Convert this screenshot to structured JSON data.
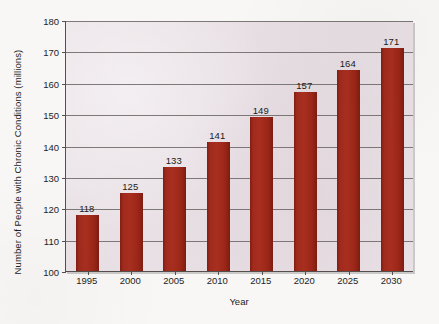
{
  "chart_data": {
    "type": "bar",
    "title": "",
    "xlabel": "Year",
    "ylabel": "Number of People with Chronic Conditions (millions)",
    "categories": [
      "1995",
      "2000",
      "2005",
      "2010",
      "2015",
      "2020",
      "2025",
      "2030"
    ],
    "values": [
      118,
      125,
      133,
      141,
      149,
      157,
      164,
      171
    ],
    "data_labels": [
      "118",
      "125",
      "133",
      "141",
      "149",
      "157",
      "164",
      "171"
    ],
    "ylim": [
      100,
      180
    ],
    "ytick_labels": [
      "180",
      "170",
      "160",
      "150",
      "140",
      "130",
      "120",
      "110",
      "100"
    ],
    "ytick_values": [
      180,
      170,
      160,
      150,
      140,
      130,
      120,
      110,
      100
    ],
    "grid": true,
    "legend": "none",
    "bar_color": "#a02a1c",
    "plot_background": "#e7dee3",
    "page_background": "#f8f7f5",
    "axis_color": "#55504f",
    "gridline_color": "#6a6564"
  }
}
